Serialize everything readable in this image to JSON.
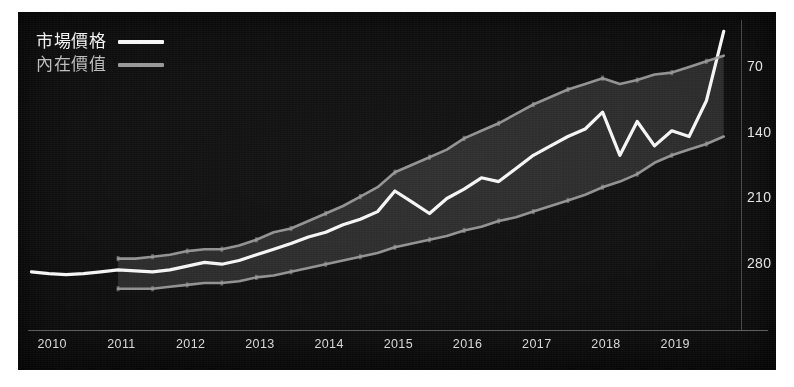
{
  "panel": {
    "background_color": "#0d0d0d",
    "border_color": "#ffffff"
  },
  "legend": {
    "position": "top-left",
    "items": [
      {
        "label": "市場價格",
        "color": "#f5f5f5",
        "name": "market-price"
      },
      {
        "label": "內在價值",
        "color": "#9a9a9a",
        "name": "intrinsic-value"
      }
    ]
  },
  "axes": {
    "y": {
      "position": "right",
      "ticks": [
        "280",
        "210",
        "140",
        "70"
      ],
      "tick_values": [
        280,
        210,
        140,
        70
      ],
      "label_color": "#e2e2e2"
    },
    "x": {
      "position": "bottom",
      "ticks": [
        "2010",
        "2011",
        "2012",
        "2013",
        "2014",
        "2015",
        "2016",
        "2017",
        "2018",
        "2019"
      ],
      "label_color": "#d8d8d8"
    }
  },
  "chart_data": {
    "type": "line",
    "title": "",
    "subtitle": "",
    "xlabel": "",
    "ylabel": "",
    "grid": false,
    "legend_position": "top-left",
    "x": [
      "2010",
      "2011",
      "2012",
      "2013",
      "2014",
      "2015",
      "2016",
      "2017",
      "2018",
      "2019",
      "2020"
    ],
    "xlim": [
      2009.7,
      2020.0
    ],
    "ylim": [
      0,
      330
    ],
    "ytick_values": [
      70,
      140,
      210,
      280
    ],
    "series": [
      {
        "name": "市場價格",
        "label_en": "Market Price",
        "color": "#f5f5f5",
        "type": "line",
        "x": [
          2009.75,
          2010.0,
          2010.25,
          2010.5,
          2010.75,
          2011.0,
          2011.25,
          2011.5,
          2011.75,
          2012.0,
          2012.25,
          2012.5,
          2012.75,
          2013.0,
          2013.25,
          2013.5,
          2013.75,
          2014.0,
          2014.25,
          2014.5,
          2014.75,
          2015.0,
          2015.25,
          2015.5,
          2015.75,
          2016.0,
          2016.25,
          2016.5,
          2016.75,
          2017.0,
          2017.25,
          2017.5,
          2017.75,
          2018.0,
          2018.25,
          2018.5,
          2018.75,
          2019.0,
          2019.25,
          2019.5,
          2019.75
        ],
        "values": [
          62,
          60,
          59,
          60,
          62,
          64,
          63,
          62,
          64,
          68,
          72,
          70,
          74,
          80,
          86,
          92,
          99,
          104,
          112,
          118,
          126,
          148,
          136,
          124,
          140,
          150,
          162,
          158,
          172,
          186,
          196,
          206,
          214,
          232,
          186,
          222,
          196,
          212,
          206,
          244,
          318
        ]
      },
      {
        "name": "內在價值 上緣",
        "label_en": "Intrinsic Value (upper)",
        "color": "#9a9a9a",
        "type": "line",
        "x": [
          2011.0,
          2011.25,
          2011.5,
          2011.75,
          2012.0,
          2012.25,
          2012.5,
          2012.75,
          2013.0,
          2013.25,
          2013.5,
          2013.75,
          2014.0,
          2014.25,
          2014.5,
          2014.75,
          2015.0,
          2015.25,
          2015.5,
          2015.75,
          2016.0,
          2016.25,
          2016.5,
          2016.75,
          2017.0,
          2017.25,
          2017.5,
          2017.75,
          2018.0,
          2018.25,
          2018.5,
          2018.75,
          2019.0,
          2019.25,
          2019.5,
          2019.75
        ],
        "values": [
          76,
          76,
          78,
          80,
          84,
          86,
          86,
          90,
          96,
          104,
          108,
          116,
          124,
          132,
          142,
          152,
          168,
          176,
          184,
          192,
          204,
          212,
          220,
          230,
          240,
          248,
          256,
          262,
          268,
          262,
          266,
          272,
          274,
          280,
          286,
          292
        ]
      },
      {
        "name": "內在價值 下緣",
        "label_en": "Intrinsic Value (lower)",
        "color": "#9a9a9a",
        "type": "line",
        "x": [
          2011.0,
          2011.25,
          2011.5,
          2011.75,
          2012.0,
          2012.25,
          2012.5,
          2012.75,
          2013.0,
          2013.25,
          2013.5,
          2013.75,
          2014.0,
          2014.25,
          2014.5,
          2014.75,
          2015.0,
          2015.25,
          2015.5,
          2015.75,
          2016.0,
          2016.25,
          2016.5,
          2016.75,
          2017.0,
          2017.25,
          2017.5,
          2017.75,
          2018.0,
          2018.25,
          2018.5,
          2018.75,
          2019.0,
          2019.25,
          2019.5,
          2019.75
        ],
        "values": [
          44,
          44,
          44,
          46,
          48,
          50,
          50,
          52,
          56,
          58,
          62,
          66,
          70,
          74,
          78,
          82,
          88,
          92,
          96,
          100,
          106,
          110,
          116,
          120,
          126,
          132,
          138,
          144,
          152,
          158,
          166,
          178,
          186,
          192,
          198,
          206
        ]
      }
    ],
    "band": {
      "name": "intrinsic-value-band",
      "fill_color": "#2b2b2b",
      "between": [
        "內在價值 上緣",
        "內在價值 下緣"
      ]
    }
  }
}
